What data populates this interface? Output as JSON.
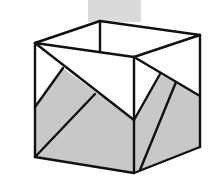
{
  "diagram": {
    "colors": {
      "background": "#ffffff",
      "shade": "#c8c8c8",
      "top_strip": "#dadada",
      "paper": "#ffffff",
      "line": "#111111"
    }
  }
}
